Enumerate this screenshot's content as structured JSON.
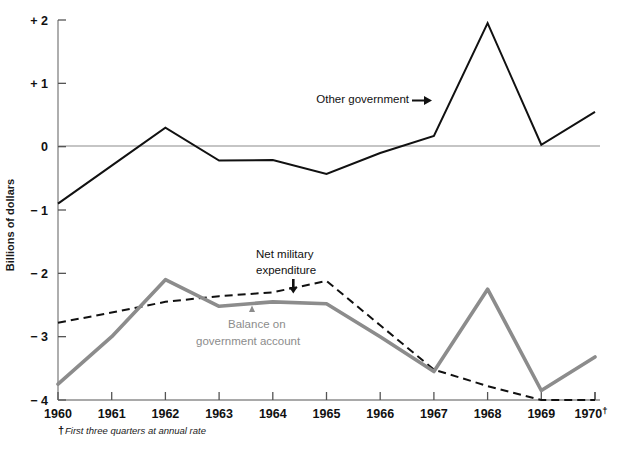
{
  "chart_data": {
    "type": "line",
    "title": "",
    "subtitle": "",
    "xlabel": "",
    "ylabel": "Billions of dollars",
    "xlim": [
      1960,
      1970
    ],
    "ylim": [
      -4,
      2
    ],
    "grid": false,
    "legend_position": "inline-annotations",
    "x": [
      1960,
      1961,
      1962,
      1963,
      1964,
      1965,
      1966,
      1967,
      1968,
      1969,
      1970
    ],
    "xtick_labels": [
      "1960",
      "1961",
      "1962",
      "1963",
      "1964",
      "1965",
      "1966",
      "1967",
      "1968",
      "1969",
      "1970"
    ],
    "xtick_last_suffix": "†",
    "ytick_values": [
      2,
      1,
      0,
      -1,
      -2,
      -3,
      -4
    ],
    "ytick_labels": [
      "+ 2",
      "+ 1",
      "0",
      "− 1",
      "− 2",
      "− 3",
      "− 4"
    ],
    "zero_line": 0,
    "series": [
      {
        "name": "Other government",
        "style": "solid",
        "color": "#111111",
        "width": 2.0,
        "label_text": "Other government",
        "label_x": 1966.3,
        "label_y": 0.61,
        "arrow": "right",
        "values": [
          -0.9,
          -0.3,
          0.3,
          -0.22,
          -0.21,
          -0.43,
          -0.1,
          0.17,
          1.95,
          0.03,
          0.55
        ]
      },
      {
        "name": "Net military expenditure",
        "style": "dashed",
        "color": "#111111",
        "width": 2.0,
        "label_text": "Net military\nexpenditure",
        "label_line_1": "Net military",
        "label_line_2": "expenditure",
        "label_x": 1964.4,
        "label_y": -1.82,
        "arrow": "down",
        "values": [
          -2.78,
          -2.62,
          -2.45,
          -2.36,
          -2.3,
          -2.12,
          -2.82,
          -3.52,
          -3.78,
          -4.0,
          -4.0
        ]
      },
      {
        "name": "Balance on government account",
        "style": "solid",
        "color": "#8c8c8c",
        "width": 3.6,
        "label_line_1": "Balance on",
        "label_line_2": "government account",
        "label_x": 1963.6,
        "label_y": -2.78,
        "arrow": "up",
        "values": [
          -3.75,
          -3.0,
          -2.1,
          -2.52,
          -2.45,
          -2.48,
          -3.0,
          -3.55,
          -2.25,
          -3.85,
          -3.32
        ]
      }
    ],
    "footnote": {
      "symbol": "†",
      "text": "First three quarters at annual rate"
    }
  },
  "colors": {
    "axis": "#8c8c8c",
    "zero_line": "#8c8c8c",
    "black_line": "#111111",
    "gray_line": "#8c8c8c",
    "text": "#1a1a1a",
    "background": "#ffffff"
  }
}
